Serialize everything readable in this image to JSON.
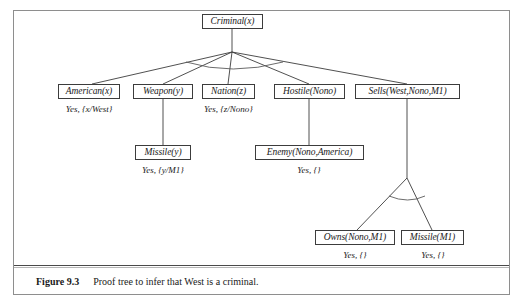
{
  "figure": {
    "caption_label": "Figure 9.3",
    "caption_text": "Proof tree to infer that West is a criminal.",
    "frame_color": "#8e8e8e",
    "line_color": "#3c3c3c"
  },
  "tree": {
    "root": {
      "id": "criminal",
      "label": "Criminal(x)",
      "answer": "",
      "x": 202,
      "y": 14,
      "width": 61
    },
    "nodes": [
      {
        "id": "american",
        "label": "American(x)",
        "answer": "Yes, {x/West}",
        "x": 58,
        "y": 84,
        "width": 62,
        "answer_x": 58,
        "answer_y": 104,
        "answer_width": 62
      },
      {
        "id": "weapon",
        "label": "Weapon(y)",
        "answer": "",
        "x": 133,
        "y": 84,
        "width": 60,
        "answer_x": 0,
        "answer_y": 0,
        "answer_width": 0
      },
      {
        "id": "nation",
        "label": "Nation(z)",
        "answer": "Yes, {z/Nono}",
        "x": 202,
        "y": 84,
        "width": 53,
        "answer_x": 194,
        "answer_y": 104,
        "answer_width": 69
      },
      {
        "id": "hostile",
        "label": "Hostile(Nono)",
        "answer": "",
        "x": 274,
        "y": 84,
        "width": 71,
        "answer_x": 0,
        "answer_y": 0,
        "answer_width": 0
      },
      {
        "id": "sells",
        "label": "Sells(West,Nono,M1)",
        "answer": "",
        "x": 355,
        "y": 84,
        "width": 105,
        "answer_x": 0,
        "answer_y": 0,
        "answer_width": 0
      },
      {
        "id": "missile-y",
        "label": "Missile(y)",
        "answer": "Yes, {y/M1}",
        "x": 135,
        "y": 145,
        "width": 56,
        "answer_x": 133,
        "answer_y": 165,
        "answer_width": 60
      },
      {
        "id": "enemy",
        "label": "Enemy(Nono,America)",
        "answer": "Yes, {}",
        "x": 255,
        "y": 145,
        "width": 109,
        "answer_x": 276,
        "answer_y": 165,
        "answer_width": 66
      },
      {
        "id": "owns",
        "label": "Owns(Nono,M1)",
        "answer": "Yes, {}",
        "x": 315,
        "y": 230,
        "width": 80,
        "answer_x": 322,
        "answer_y": 250,
        "answer_width": 66
      },
      {
        "id": "missile-m1",
        "label": "Missile(M1)",
        "answer": "Yes, {}",
        "x": 401,
        "y": 230,
        "width": 63,
        "answer_x": 400,
        "answer_y": 250,
        "answer_width": 66
      }
    ],
    "edges": [
      {
        "id": "root-stem",
        "from": "criminal",
        "to": "fan-apex",
        "x1": 232,
        "y1": 29,
        "x2": 232,
        "y2": 52
      },
      {
        "id": "root-american",
        "from": "criminal",
        "to": "american",
        "x1": 232,
        "y1": 52,
        "x2": 92,
        "y2": 84
      },
      {
        "id": "root-weapon",
        "from": "criminal",
        "to": "weapon",
        "x1": 232,
        "y1": 52,
        "x2": 163,
        "y2": 84
      },
      {
        "id": "root-nation",
        "from": "criminal",
        "to": "nation",
        "x1": 232,
        "y1": 52,
        "x2": 228,
        "y2": 84
      },
      {
        "id": "root-hostile",
        "from": "criminal",
        "to": "hostile",
        "x1": 232,
        "y1": 52,
        "x2": 309,
        "y2": 84
      },
      {
        "id": "root-sells",
        "from": "criminal",
        "to": "sells",
        "x1": 232,
        "y1": 52,
        "x2": 407,
        "y2": 84
      },
      {
        "id": "weapon-missile",
        "from": "weapon",
        "to": "missile-y",
        "x1": 163,
        "y1": 99,
        "x2": 163,
        "y2": 145
      },
      {
        "id": "hostile-enemy",
        "from": "hostile",
        "to": "enemy",
        "x1": 309,
        "y1": 99,
        "x2": 309,
        "y2": 145
      },
      {
        "id": "sells-stem",
        "from": "sells",
        "to": "sells-apex",
        "x1": 407,
        "y1": 99,
        "x2": 407,
        "y2": 178
      },
      {
        "id": "sells-owns",
        "from": "sells",
        "to": "owns",
        "x1": 407,
        "y1": 178,
        "x2": 357,
        "y2": 230
      },
      {
        "id": "sells-missile",
        "from": "sells",
        "to": "missile-m1",
        "x1": 407,
        "y1": 178,
        "x2": 432,
        "y2": 230
      }
    ],
    "and_arcs": [
      {
        "id": "root-and-arc",
        "path": "M 186 62 Q 232 76 283 62"
      },
      {
        "id": "sells-and-arc",
        "path": "M 389 196 Q 408 204 425 196"
      }
    ]
  }
}
